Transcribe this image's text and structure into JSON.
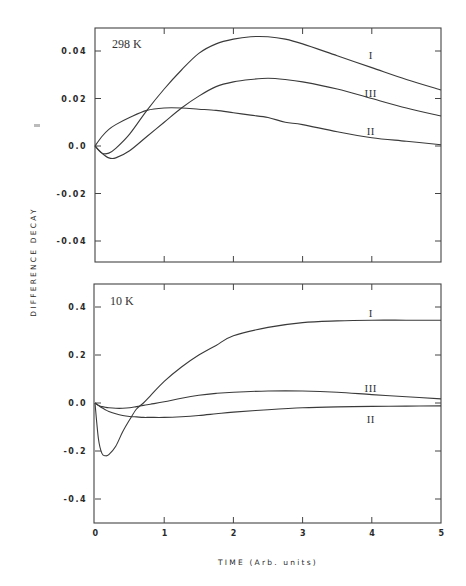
{
  "figure": {
    "ylabel": "DIFFERENCE DECAY",
    "xlabel": "TIME (Arb. units)"
  },
  "chart_data": [
    {
      "type": "line",
      "title": "298 K",
      "xlabel": "TIME (Arb. units)",
      "ylabel": "DIFFERENCE DECAY",
      "xlim": [
        0,
        5
      ],
      "ylim": [
        -0.0487,
        0.0497
      ],
      "x_ticks": [
        0,
        1,
        2,
        3,
        4,
        5
      ],
      "y_ticks": [
        0.04,
        0.02,
        0.0,
        -0.02,
        -0.04
      ],
      "y_tick_labels": [
        "0.04",
        "0.02",
        "0.0",
        "-0.02",
        "-0.04"
      ],
      "grid": false,
      "legend": "inline labels near x=4",
      "x": [
        0,
        0.1,
        0.2,
        0.3,
        0.5,
        0.75,
        1.0,
        1.25,
        1.5,
        1.75,
        2.0,
        2.25,
        2.5,
        2.75,
        3.0,
        3.5,
        4.0,
        4.5,
        5.0
      ],
      "series": [
        {
          "name": "I",
          "label_pos": [
            4.0,
            0.0383
          ],
          "values": [
            0.0,
            -0.003,
            -0.003,
            -0.001,
            0.005,
            0.015,
            0.024,
            0.032,
            0.039,
            0.043,
            0.045,
            0.046,
            0.046,
            0.045,
            0.043,
            0.038,
            0.033,
            0.028,
            0.0236
          ]
        },
        {
          "name": "III",
          "label_pos": [
            4.0,
            0.0222
          ],
          "values": [
            0.0,
            -0.003,
            -0.005,
            -0.005,
            -0.002,
            0.004,
            0.01,
            0.016,
            0.021,
            0.025,
            0.027,
            0.028,
            0.0285,
            0.028,
            0.027,
            0.024,
            0.02,
            0.016,
            0.0126
          ]
        },
        {
          "name": "II",
          "label_pos": [
            4.0,
            0.0063
          ],
          "values": [
            0.0,
            0.004,
            0.007,
            0.009,
            0.012,
            0.015,
            0.016,
            0.016,
            0.0155,
            0.015,
            0.014,
            0.013,
            0.012,
            0.01,
            0.009,
            0.006,
            0.0035,
            0.002,
            0.0005
          ]
        }
      ]
    },
    {
      "type": "line",
      "title": "10 K",
      "xlabel": "TIME (Arb. units)",
      "ylabel": "DIFFERENCE DECAY",
      "xlim": [
        0,
        5
      ],
      "ylim": [
        -0.498,
        0.496
      ],
      "x_ticks": [
        0,
        1,
        2,
        3,
        4,
        5
      ],
      "x_tick_labels": [
        "0",
        "1",
        "2",
        "3",
        "4",
        "5"
      ],
      "y_ticks": [
        0.4,
        0.2,
        0.0,
        -0.2,
        -0.4
      ],
      "y_tick_labels": [
        "0.4",
        "0.2",
        "0.0",
        "-0.2",
        "-0.4"
      ],
      "grid": false,
      "legend": "inline labels near x=4",
      "x": [
        0,
        0.05,
        0.1,
        0.15,
        0.2,
        0.3,
        0.4,
        0.5,
        0.6,
        0.7,
        0.8,
        1.0,
        1.25,
        1.5,
        1.75,
        2.0,
        2.5,
        3.0,
        3.5,
        4.0,
        4.5,
        5.0
      ],
      "series": [
        {
          "name": "I",
          "label_pos": [
            4.0,
            0.375
          ],
          "values": [
            0.0,
            -0.15,
            -0.21,
            -0.22,
            -0.215,
            -0.18,
            -0.12,
            -0.07,
            -0.025,
            0.0,
            0.03,
            0.09,
            0.15,
            0.2,
            0.24,
            0.28,
            0.315,
            0.335,
            0.342,
            0.345,
            0.345,
            0.345
          ]
        },
        {
          "name": "III",
          "label_pos": [
            4.0,
            0.063
          ],
          "values": [
            0.0,
            -0.01,
            -0.015,
            -0.018,
            -0.02,
            -0.022,
            -0.022,
            -0.02,
            -0.015,
            -0.01,
            -0.005,
            0.005,
            0.02,
            0.032,
            0.04,
            0.045,
            0.05,
            0.05,
            0.045,
            0.035,
            0.026,
            0.017
          ]
        },
        {
          "name": "II",
          "label_pos": [
            4.0,
            -0.068
          ],
          "values": [
            0.0,
            -0.01,
            -0.02,
            -0.028,
            -0.035,
            -0.045,
            -0.052,
            -0.056,
            -0.058,
            -0.06,
            -0.06,
            -0.06,
            -0.057,
            -0.052,
            -0.045,
            -0.038,
            -0.028,
            -0.02,
            -0.016,
            -0.014,
            -0.013,
            -0.012
          ]
        }
      ]
    }
  ]
}
